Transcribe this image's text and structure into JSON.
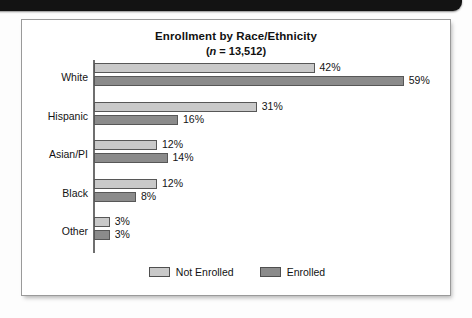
{
  "figure": {
    "title_line_1": "Enrollment by Race/Ethnicity",
    "title_n_symbol": "n",
    "title_n_value": "( = 13,512)",
    "title_line_2_prefix": "(",
    "title_line_2_suffix": " = 13,512)"
  },
  "legend": {
    "items": [
      {
        "label": "Not Enrolled",
        "swatch": "light",
        "color": "#c9c9c9"
      },
      {
        "label": "Enrolled",
        "swatch": "dark",
        "color": "#8b8b8b"
      }
    ]
  },
  "chart_data": {
    "type": "bar",
    "orientation": "horizontal",
    "title": "Enrollment by Race/Ethnicity",
    "subtitle": "(n = 13,512)",
    "n": 13512,
    "xlabel": "",
    "ylabel": "",
    "xlim": [
      0,
      62
    ],
    "grid": false,
    "legend_position": "bottom-center",
    "categories": [
      "White",
      "Hispanic",
      "Asian/PI",
      "Black",
      "Other"
    ],
    "series": [
      {
        "name": "Not Enrolled",
        "color": "#c9c9c9",
        "values": [
          42,
          31,
          12,
          12,
          3
        ],
        "labels": [
          "42%",
          "31%",
          "12%",
          "12%",
          "3%"
        ]
      },
      {
        "name": "Enrolled",
        "color": "#8b8b8b",
        "values": [
          59,
          16,
          14,
          8,
          3
        ],
        "labels": [
          "59%",
          "16%",
          "14%",
          "8%",
          "3%"
        ]
      }
    ],
    "value_unit": "%"
  }
}
